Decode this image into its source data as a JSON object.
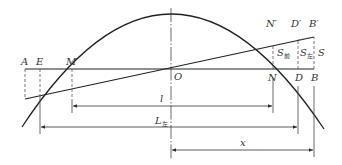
{
  "diagram": {
    "colors": {
      "line": "#2a2a2a",
      "dashed": "#555555",
      "text": "#333333",
      "background": "#ffffff"
    },
    "points": {
      "A": "A",
      "E": "E",
      "M": "M",
      "O": "O",
      "N": "N",
      "D": "D",
      "B": "B",
      "N_prime": "N′",
      "D_prime": "D′",
      "B_prime": "B′"
    },
    "areas": {
      "S_qian": {
        "main": "S",
        "sub": "前"
      },
      "S_zuo": {
        "main": "S",
        "sub": "左"
      },
      "S": "S"
    },
    "dimensions": {
      "l": "l",
      "L": {
        "main": "L",
        "sub": "左"
      },
      "x": "x"
    }
  }
}
